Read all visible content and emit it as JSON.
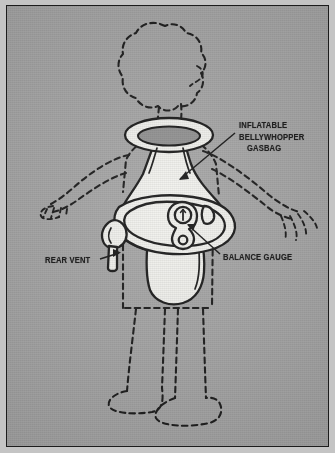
{
  "plate": {
    "kind": "technical-cutaway-illustration",
    "subject": "Person wearing an inflatable bellywhopper gasbag flotation device",
    "background_color": "#a5a5a5",
    "border_color": "#1c1c1c",
    "ink_color": "#101010",
    "device_fill": "#f2f2ee"
  },
  "labels": {
    "gasbag": {
      "name": "inflatable-gasbag-label",
      "line1": "INFLATABLE",
      "line2": "BELLYWHOPPER",
      "line3": "GASBAG"
    },
    "rear_vent": {
      "name": "rear-vent-label",
      "text": "REAR VENT"
    },
    "balance_gauge": {
      "name": "balance-gauge-label",
      "text": "BALANCE GAUGE"
    }
  },
  "parts": [
    {
      "id": "ghost-figure",
      "label": "dashed human figure outline",
      "style": "dashed"
    },
    {
      "id": "collar-ring",
      "label": "neck collar ring",
      "style": "solid"
    },
    {
      "id": "gasbag-body",
      "label": "inflatable gasbag body",
      "style": "solid"
    },
    {
      "id": "waist-belt",
      "label": "waist belt hoop",
      "style": "solid"
    },
    {
      "id": "rear-vent",
      "label": "rear vent nozzle",
      "style": "solid"
    },
    {
      "id": "balance-gauge",
      "label": "balance gauge dial",
      "style": "solid"
    }
  ]
}
